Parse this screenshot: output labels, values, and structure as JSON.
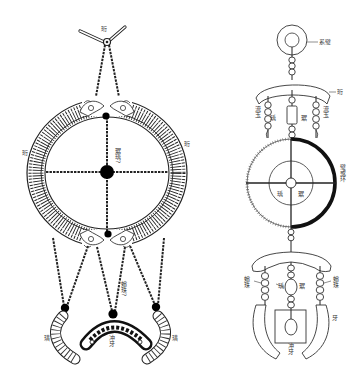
{
  "figure": {
    "background": "#ffffff",
    "ink_color": "#000000",
    "left_diagram": {
      "title": "Jade pendant set reconstruction with dragon ring",
      "labels": {
        "top_connector": "珩",
        "ring_left": "珩",
        "ring_right": "珩",
        "center_bead": "琚瑀?",
        "pendant_left": "璜",
        "pendant_right": "璜",
        "lower_bead": "蠙珠?",
        "bottom_center": "冲牙"
      }
    },
    "right_diagram": {
      "title": "Schematic pendant set",
      "labels": {
        "top_disc": "系璧",
        "upper_arch": "珩",
        "upper_left_strand": "流玉",
        "upper_right_strand": "流玉",
        "upper_center_left": "瑀",
        "upper_center_right": "琚",
        "middle_ring": "璧或环",
        "ring_center_left": "瑀",
        "ring_center_right": "琚",
        "lower_left_strand": "蠙珠",
        "lower_right_strand": "蠙珠",
        "lower_center_left": "瑀",
        "lower_center_right": "琚",
        "lower_right_tooth": "牙",
        "bottom_center": "冲牙"
      }
    }
  }
}
